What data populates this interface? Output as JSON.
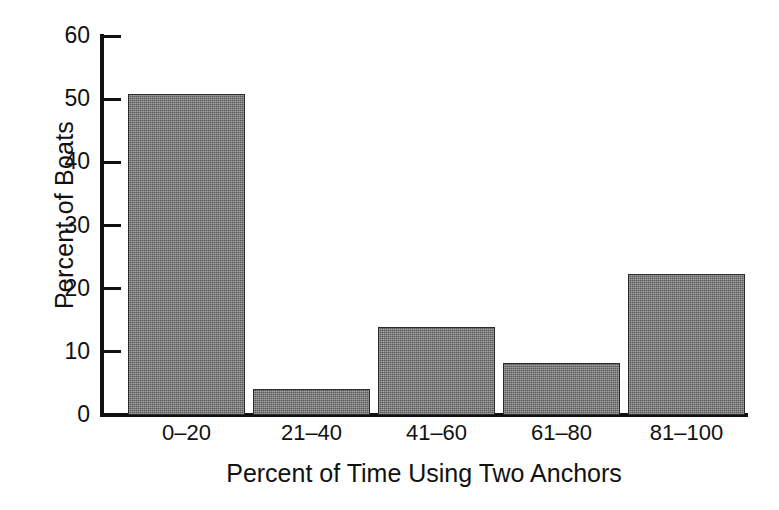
{
  "chart_data": {
    "type": "bar",
    "title": "",
    "subtitle": "",
    "xlabel": "Percent of Time Using Two Anchors",
    "ylabel": "Percent of Boats",
    "categories": [
      "0–20",
      "21–40",
      "41–60",
      "61–80",
      "81–100"
    ],
    "values": [
      50.8,
      4.1,
      14.0,
      8.3,
      22.3
    ],
    "series": [
      {
        "name": "Percent of Boats",
        "values": [
          50.8,
          4.1,
          14.0,
          8.3,
          22.3
        ]
      }
    ],
    "ylim": [
      0,
      60
    ],
    "yticks": [
      0,
      10,
      20,
      30,
      40,
      50,
      60
    ],
    "ytick_labels": [
      "0",
      "10",
      "20",
      "30",
      "40",
      "50",
      "60"
    ],
    "grid": false,
    "legend": false,
    "legend_position": "none",
    "bar_color": "#7e7e7e",
    "bar_edge_color": "#2b2b2b",
    "axis_color": "#111111",
    "background_color": "#ffffff",
    "annotations": []
  }
}
